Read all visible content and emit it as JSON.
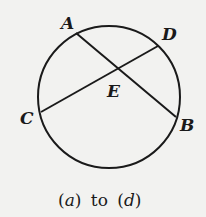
{
  "diagram": {
    "type": "circle-with-intersecting-chords",
    "circle": {
      "cx": 109,
      "cy": 97,
      "r": 71
    },
    "points": {
      "A": {
        "label": "A",
        "x": 76,
        "y": 33
      },
      "B": {
        "label": "B",
        "x": 176,
        "y": 117
      },
      "C": {
        "label": "C",
        "x": 41,
        "y": 112
      },
      "D": {
        "label": "D",
        "x": 158,
        "y": 46
      },
      "E": {
        "label": "E",
        "x": 118,
        "y": 69
      }
    },
    "chords": [
      "AB",
      "CD"
    ],
    "intersection": "E",
    "stroke_color": "#1a1a1a",
    "background_color": "#f2f2f0"
  },
  "caption": {
    "open_a": "(",
    "a": "a",
    "close_a": ")",
    "to": "to",
    "open_d": "(",
    "d": "d",
    "close_d": ")"
  }
}
